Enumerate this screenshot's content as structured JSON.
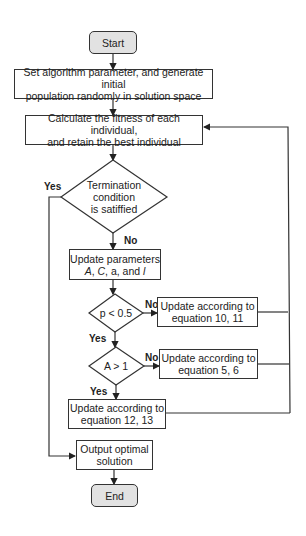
{
  "flowchart": {
    "start": "Start",
    "init": {
      "line1": "Set algorithm parameter, and generate initial",
      "line2": "population randomly in solution space"
    },
    "fitness": {
      "line1": "Calculate the fitness of each individual,",
      "line2": "and retain the best individual"
    },
    "termination": {
      "line1": "Termination",
      "line2": "condition",
      "line3": "is satiffied"
    },
    "update_params": {
      "line1": "Update parameters",
      "p1": "A",
      "sep1": ", ",
      "p2": "C",
      "sep2": ", a, and ",
      "p3": "l"
    },
    "cond_p": "p < 0.5",
    "cond_a": "A > 1",
    "eq_10_11": {
      "line1": "Update according to",
      "line2": "equation 10, 11"
    },
    "eq_5_6": {
      "line1": "Update according to",
      "line2": "equation 5, 6"
    },
    "eq_12_13": {
      "line1": "Update according to",
      "line2": "equation 12, 13"
    },
    "output": {
      "line1": "Output optimal",
      "line2": "solution"
    },
    "end": "End",
    "labels": {
      "yes_term": "Yes",
      "no_term": "No",
      "no_p": "No",
      "yes_p": "Yes",
      "no_a": "No",
      "yes_a": "Yes"
    }
  }
}
